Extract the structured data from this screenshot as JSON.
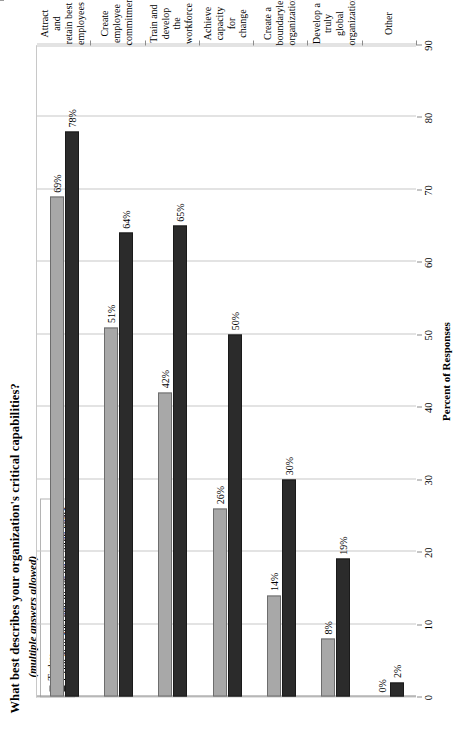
{
  "chart": {
    "title": "What best describes your organization's critical capabilities?",
    "subtitle": "(multiple answers allowed)",
    "value_axis_title": "Percent of Responses",
    "legend": [
      {
        "label": "Today",
        "color": "#a8a8a8"
      },
      {
        "label": "Critical to succeed in the next three years",
        "color": "#2b2b2b"
      }
    ]
  },
  "chart_data": {
    "type": "bar",
    "orientation": "vertical",
    "title": "What best describes your organization's critical capabilities?",
    "subtitle": "(multiple answers allowed)",
    "xlabel": "",
    "ylabel": "Percent of Responses",
    "ylim": [
      0,
      90
    ],
    "yticks": [
      0,
      10,
      20,
      30,
      40,
      50,
      60,
      70,
      80,
      90
    ],
    "ytick_labels": [
      "0",
      "10",
      "20",
      "30",
      "40",
      "50",
      "60",
      "70",
      "80",
      "90"
    ],
    "grid": true,
    "legend_position": "top-left",
    "categories": [
      "Attract and retain best employees",
      "Create employee commitment",
      "Train and develop the workforce",
      "Achieve capacity for change",
      "Create a boundaryless organization",
      "Develop a truly global organization",
      "Other"
    ],
    "category_lines": [
      [
        "Attract and",
        "retain best",
        "employees"
      ],
      [
        "Create",
        "employee",
        "commitment"
      ],
      [
        "Train and",
        "develop the",
        "workforce"
      ],
      [
        "Achieve",
        "capacity for",
        "change"
      ],
      [
        "Create a",
        "boundaryless",
        "organization"
      ],
      [
        "Develop a truly",
        "global",
        "organization"
      ],
      [
        "Other"
      ]
    ],
    "series": [
      {
        "name": "Today",
        "color": "#a8a8a8",
        "values": [
          69,
          51,
          42,
          26,
          14,
          8,
          0
        ],
        "labels": [
          "69%",
          "51%",
          "42%",
          "26%",
          "14%",
          "8%",
          "0%"
        ]
      },
      {
        "name": "Critical to succeed in the next three years",
        "color": "#2b2b2b",
        "values": [
          78,
          64,
          65,
          50,
          30,
          19,
          2
        ],
        "labels": [
          "78%",
          "64%",
          "65%",
          "50%",
          "30%",
          "19%",
          "2%"
        ]
      }
    ]
  }
}
